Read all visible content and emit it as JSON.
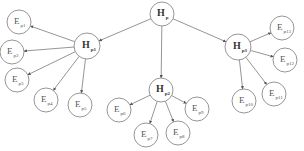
{
  "diagram": {
    "type": "hierarchy-tree",
    "root": {
      "id": "Hp",
      "letter": "H",
      "sub": "p",
      "x": 162,
      "y": 14,
      "r": 12
    },
    "hubs": [
      {
        "id": "Hp1",
        "letter": "H",
        "sub": "p1",
        "x": 87,
        "y": 46,
        "r": 13
      },
      {
        "id": "Hp2",
        "letter": "H",
        "sub": "p2",
        "x": 161,
        "y": 90,
        "r": 12
      },
      {
        "id": "Hp3",
        "letter": "H",
        "sub": "p3",
        "x": 238,
        "y": 47,
        "r": 13
      }
    ],
    "leaves": [
      {
        "id": "Ep1",
        "letter": "E",
        "sub": "p1",
        "parent": "Hp1",
        "x": 19,
        "y": 22,
        "r": 12
      },
      {
        "id": "Ep2",
        "letter": "E",
        "sub": "p2",
        "parent": "Hp1",
        "x": 12,
        "y": 52,
        "r": 12
      },
      {
        "id": "Ep3",
        "letter": "E",
        "sub": "p3",
        "parent": "Hp1",
        "x": 17,
        "y": 80,
        "r": 12
      },
      {
        "id": "Ep4",
        "letter": "E",
        "sub": "p4",
        "parent": "Hp1",
        "x": 46,
        "y": 100,
        "r": 12
      },
      {
        "id": "Ep5",
        "letter": "E",
        "sub": "p5",
        "parent": "Hp1",
        "x": 80,
        "y": 105,
        "r": 12
      },
      {
        "id": "Ep6",
        "letter": "E",
        "sub": "p6",
        "parent": "Hp2",
        "x": 119,
        "y": 110,
        "r": 12
      },
      {
        "id": "Ep7",
        "letter": "E",
        "sub": "p7",
        "parent": "Hp2",
        "x": 146,
        "y": 135,
        "r": 12
      },
      {
        "id": "Ep8",
        "letter": "E",
        "sub": "p8",
        "parent": "Hp2",
        "x": 178,
        "y": 133,
        "r": 12
      },
      {
        "id": "Ep9",
        "letter": "E",
        "sub": "p9",
        "parent": "Hp2",
        "x": 197,
        "y": 109,
        "r": 12
      },
      {
        "id": "Ep10",
        "letter": "E",
        "sub": "p10",
        "parent": "Hp3",
        "x": 244,
        "y": 101,
        "r": 12
      },
      {
        "id": "Ep11",
        "letter": "E",
        "sub": "p11",
        "parent": "Hp3",
        "x": 274,
        "y": 94,
        "r": 12
      },
      {
        "id": "Ep12",
        "letter": "E",
        "sub": "p12",
        "parent": "Hp3",
        "x": 285,
        "y": 60,
        "r": 12
      },
      {
        "id": "Ep13",
        "letter": "E",
        "sub": "p13",
        "parent": "Hp3",
        "x": 282,
        "y": 28,
        "r": 12
      }
    ],
    "colors": {
      "stroke": "#8a8a8a",
      "edge": "#7a7a7a",
      "text": "#555555",
      "background": "#ffffff"
    }
  }
}
